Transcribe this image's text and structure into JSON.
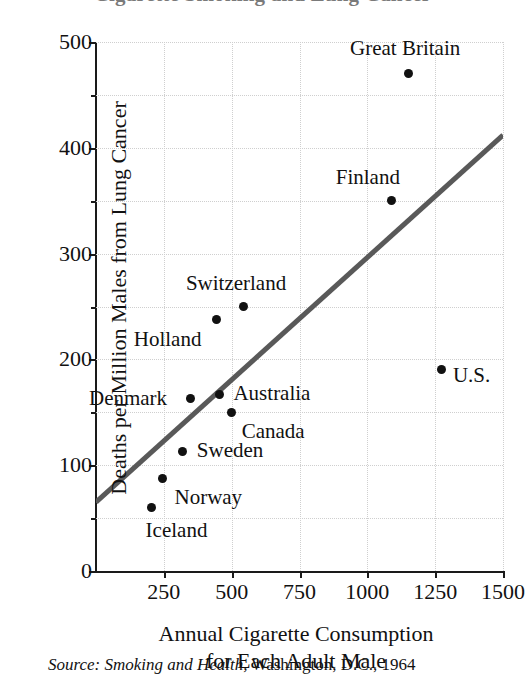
{
  "title": "Cigarette Smoking and Lung Cancer",
  "source": {
    "italic": "Source:  Smoking and Health,",
    "roman": " Washington, D.C., 1964"
  },
  "chart_data": {
    "type": "scatter",
    "title": "Cigarette Smoking and Lung Cancer",
    "xlabel_line1": "Annual Cigarette Consumption",
    "xlabel_line2": "for Each Adult Male",
    "ylabel": "Deaths per Million Males from Lung Cancer",
    "xlim": [
      0,
      1500
    ],
    "ylim": [
      0,
      500
    ],
    "xticks": [
      0,
      250,
      500,
      750,
      1000,
      1250,
      1500
    ],
    "xticklabels": [
      "",
      "250",
      "500",
      "750",
      "1000",
      "1250",
      "1500"
    ],
    "yticks": [
      0,
      100,
      200,
      300,
      400,
      500
    ],
    "yticklabels": [
      "0",
      "100",
      "200",
      "300",
      "400",
      "500"
    ],
    "yminorticks": [
      50,
      150,
      250,
      350,
      450
    ],
    "grid": true,
    "grid_style": "dotted",
    "legend": "none",
    "points": [
      {
        "label": "Iceland",
        "x": 205,
        "y": 60,
        "label_dx": -6,
        "label_dy": 22
      },
      {
        "label": "Norway",
        "x": 245,
        "y": 87,
        "label_dx": 12,
        "label_dy": 18
      },
      {
        "label": "Sweden",
        "x": 320,
        "y": 113,
        "label_dx": 14,
        "label_dy": -1
      },
      {
        "label": "Denmark",
        "x": 350,
        "y": 163,
        "label_dx": -102,
        "label_dy": -1
      },
      {
        "label": "Holland",
        "x": 445,
        "y": 238,
        "label_dx": -83,
        "label_dy": 20
      },
      {
        "label": "Australia",
        "x": 455,
        "y": 167,
        "label_dx": 14,
        "label_dy": -1
      },
      {
        "label": "Canada",
        "x": 500,
        "y": 150,
        "label_dx": 10,
        "label_dy": 19
      },
      {
        "label": "Switzerland",
        "x": 545,
        "y": 250,
        "label_dx": -58,
        "label_dy": -24
      },
      {
        "label": "Finland",
        "x": 1090,
        "y": 350,
        "label_dx": -56,
        "label_dy": -24
      },
      {
        "label": "Great Britain",
        "x": 1150,
        "y": 470,
        "label_dx": -58,
        "label_dy": -26
      },
      {
        "label": "U.S.",
        "x": 1275,
        "y": 190,
        "label_dx": 11,
        "label_dy": 5
      }
    ],
    "trend_line": {
      "name": "regression line",
      "x0": 0,
      "y0": 65,
      "x1": 1500,
      "y1": 412,
      "color": "#595959",
      "width": 5
    }
  },
  "colors": {
    "point": "#111111",
    "axis": "#1a1a1a",
    "grid": "#cfcfcf",
    "trend": "#595959",
    "background": "#ffffff"
  }
}
